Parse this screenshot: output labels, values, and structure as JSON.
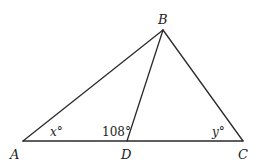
{
  "diagram": {
    "type": "triangle",
    "points": {
      "A": {
        "label": "A",
        "x": 23,
        "y": 141
      },
      "B": {
        "label": "B",
        "x": 163,
        "y": 30
      },
      "C": {
        "label": "C",
        "x": 243,
        "y": 141
      },
      "D": {
        "label": "D",
        "x": 127,
        "y": 141
      }
    },
    "segments": [
      "AB",
      "BC",
      "AC",
      "BD"
    ],
    "angles": {
      "A": {
        "label": "x°",
        "vertex": "A"
      },
      "BDA": {
        "label": "108°",
        "vertex": "D"
      },
      "C": {
        "label": "y°",
        "vertex": "C"
      }
    }
  }
}
